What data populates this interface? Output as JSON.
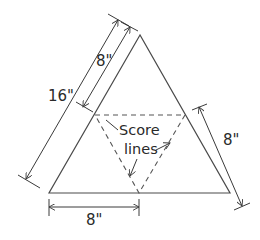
{
  "diagram": {
    "labels": {
      "total_side": "16\"",
      "upper_side": "8\"",
      "right_side": "8\"",
      "bottom_side": "8\"",
      "score_line_1": "Score",
      "score_line_2": "lines"
    },
    "colors": {
      "line": "#4a4a4a",
      "dashed": "#555555",
      "text": "#2a2a2a",
      "background": "#ffffff"
    }
  }
}
